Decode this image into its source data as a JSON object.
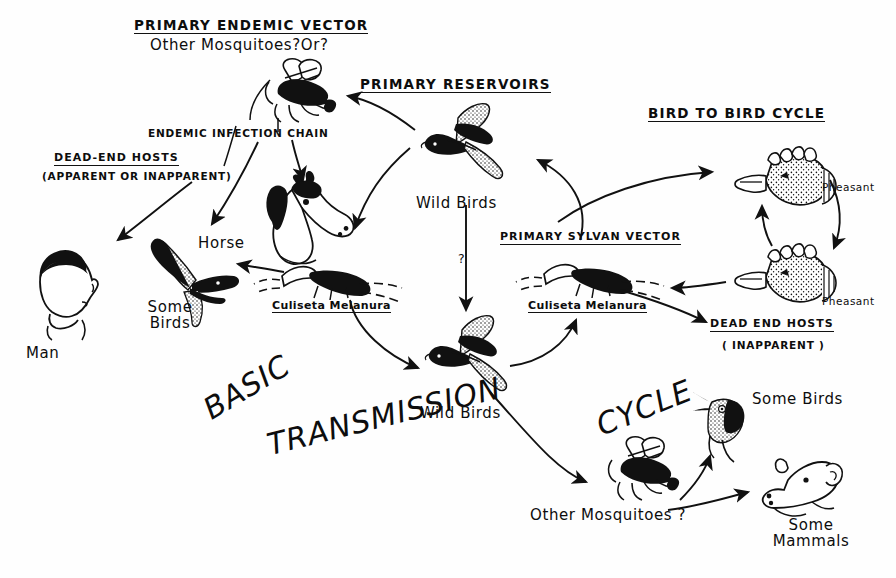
{
  "diagram": {
    "title_overlay": "BASIC TRANSMISSION CYCLE",
    "title_words": [
      "BASIC",
      "TRANSMISSION",
      "CYCLE"
    ],
    "headings": {
      "primary_endemic_vector": "PRIMARY ENDEMIC VECTOR",
      "primary_reservoirs": "PRIMARY RESERVOIRS",
      "bird_to_bird_cycle": "BIRD TO BIRD CYCLE",
      "dead_end_hosts_left": "DEAD-END HOSTS",
      "dead_end_hosts_left_sub": "(APPARENT OR INAPPARENT)",
      "dead_end_hosts_right": "DEAD END HOSTS",
      "dead_end_hosts_right_sub": "( INAPPARENT )",
      "primary_sylvan_vector": "PRIMARY SYLVAN VECTOR",
      "endemic_infection_chain": "ENDEMIC INFECTION CHAIN"
    },
    "nodes": [
      {
        "id": "endemic-mosquito",
        "label": "Other Mosquitoes?Or?",
        "icon": "mosquito-icon"
      },
      {
        "id": "horse",
        "label": "Horse",
        "icon": "horse-head-icon"
      },
      {
        "id": "man",
        "label": "Man",
        "icon": "man-head-icon"
      },
      {
        "id": "some-birds-left",
        "label": "Some Birds",
        "icon": "bird-flying-icon"
      },
      {
        "id": "culiseta-left",
        "label": "Culiseta Melanura",
        "icon": "mosquito-culiseta-icon"
      },
      {
        "id": "wild-birds-top",
        "label": "Wild Birds",
        "icon": "bird-flying-icon"
      },
      {
        "id": "wild-birds-bottom",
        "label": "Wild Birds",
        "icon": "bird-flying-icon"
      },
      {
        "id": "culiseta-right",
        "label": "Culiseta Melanura",
        "icon": "mosquito-culiseta-icon"
      },
      {
        "id": "pheasant-top",
        "label": "Pheasant",
        "icon": "pheasant-head-icon"
      },
      {
        "id": "pheasant-bottom",
        "label": "Pheasant",
        "icon": "pheasant-head-icon"
      },
      {
        "id": "other-mosquitoes",
        "label": "Other Mosquitoes ?",
        "icon": "mosquito-icon"
      },
      {
        "id": "some-birds-right",
        "label": "Some Birds",
        "icon": "bird-head-icon"
      },
      {
        "id": "some-mammals",
        "label": "Some Mammals",
        "icon": "mammal-head-icon"
      }
    ],
    "unknown_link_marker": "?",
    "colors": {
      "ink": "#0d0d0d",
      "paper": "#fefefe"
    }
  }
}
